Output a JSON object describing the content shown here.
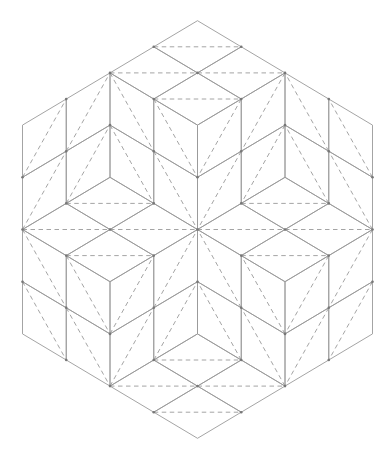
{
  "diagram": {
    "colors": {
      "background": "#ffffff",
      "line": "#9a9a9a",
      "vertex": "#777777"
    },
    "grid": {
      "origin_x": 197.5,
      "origin_y": 229.5,
      "step_x": 43.75,
      "step_y": 26.1
    },
    "hexagon": [
      [
        0,
        -8
      ],
      [
        4,
        -4
      ],
      [
        4,
        4
      ],
      [
        0,
        8
      ],
      [
        -4,
        4
      ],
      [
        -4,
        -4
      ]
    ],
    "lozenges": [
      {
        "v": [
          [
            0,
            -8
          ],
          [
            1,
            -7
          ],
          [
            0,
            -6
          ],
          [
            -1,
            -7
          ]
        ],
        "d": [
          [
            -1,
            -7
          ],
          [
            1,
            -7
          ]
        ]
      },
      {
        "v": [
          [
            -2,
            -6
          ],
          [
            -1,
            -7
          ],
          [
            0,
            -6
          ],
          [
            -1,
            -5
          ]
        ],
        "d": [
          [
            -2,
            -6
          ],
          [
            0,
            -6
          ]
        ]
      },
      {
        "v": [
          [
            0,
            -6
          ],
          [
            1,
            -7
          ],
          [
            2,
            -6
          ],
          [
            1,
            -5
          ]
        ],
        "d": [
          [
            0,
            -6
          ],
          [
            2,
            -6
          ]
        ]
      },
      {
        "v": [
          [
            -1,
            -5
          ],
          [
            0,
            -6
          ],
          [
            1,
            -5
          ],
          [
            0,
            -4
          ]
        ],
        "d": [
          [
            -1,
            -5
          ],
          [
            1,
            -5
          ]
        ]
      },
      {
        "v": [
          [
            -4,
            -4
          ],
          [
            -3,
            -5
          ],
          [
            -3,
            -3
          ],
          [
            -4,
            -2
          ]
        ],
        "d": [
          [
            -4,
            -2
          ],
          [
            -3,
            -5
          ]
        ]
      },
      {
        "v": [
          [
            -4,
            -2
          ],
          [
            -3,
            -3
          ],
          [
            -3,
            -1
          ],
          [
            -4,
            0
          ]
        ],
        "d": [
          [
            -4,
            0
          ],
          [
            -3,
            -3
          ]
        ]
      },
      {
        "v": [
          [
            -3,
            -5
          ],
          [
            -2,
            -6
          ],
          [
            -2,
            -4
          ],
          [
            -3,
            -3
          ]
        ],
        "d": [
          [
            -3,
            -3
          ],
          [
            -2,
            -6
          ]
        ]
      },
      {
        "v": [
          [
            -3,
            -3
          ],
          [
            -2,
            -4
          ],
          [
            -2,
            -2
          ],
          [
            -3,
            -1
          ]
        ],
        "d": [
          [
            -3,
            -1
          ],
          [
            -2,
            -4
          ]
        ]
      },
      {
        "v": [
          [
            -2,
            -6
          ],
          [
            -1,
            -5
          ],
          [
            -1,
            -3
          ],
          [
            -2,
            -4
          ]
        ],
        "d": [
          [
            -2,
            -6
          ],
          [
            -1,
            -3
          ]
        ]
      },
      {
        "v": [
          [
            -2,
            -4
          ],
          [
            -1,
            -3
          ],
          [
            -1,
            -1
          ],
          [
            -2,
            -2
          ]
        ],
        "d": [
          [
            -2,
            -4
          ],
          [
            -1,
            -1
          ]
        ]
      },
      {
        "v": [
          [
            -1,
            -5
          ],
          [
            0,
            -4
          ],
          [
            0,
            -2
          ],
          [
            -1,
            -3
          ]
        ],
        "d": [
          [
            -1,
            -5
          ],
          [
            0,
            -2
          ]
        ]
      },
      {
        "v": [
          [
            -1,
            -3
          ],
          [
            0,
            -2
          ],
          [
            0,
            0
          ],
          [
            -1,
            -1
          ]
        ],
        "d": [
          [
            -1,
            -3
          ],
          [
            0,
            0
          ]
        ]
      },
      {
        "v": [
          [
            4,
            -4
          ],
          [
            3,
            -5
          ],
          [
            3,
            -3
          ],
          [
            4,
            -2
          ]
        ],
        "d": [
          [
            4,
            -2
          ],
          [
            3,
            -5
          ]
        ]
      },
      {
        "v": [
          [
            4,
            -2
          ],
          [
            3,
            -3
          ],
          [
            3,
            -1
          ],
          [
            4,
            0
          ]
        ],
        "d": [
          [
            4,
            0
          ],
          [
            3,
            -3
          ]
        ]
      },
      {
        "v": [
          [
            3,
            -5
          ],
          [
            2,
            -6
          ],
          [
            2,
            -4
          ],
          [
            3,
            -3
          ]
        ],
        "d": [
          [
            3,
            -3
          ],
          [
            2,
            -6
          ]
        ]
      },
      {
        "v": [
          [
            3,
            -3
          ],
          [
            2,
            -4
          ],
          [
            2,
            -2
          ],
          [
            3,
            -1
          ]
        ],
        "d": [
          [
            3,
            -1
          ],
          [
            2,
            -4
          ]
        ]
      },
      {
        "v": [
          [
            2,
            -6
          ],
          [
            1,
            -5
          ],
          [
            1,
            -3
          ],
          [
            2,
            -4
          ]
        ],
        "d": [
          [
            2,
            -6
          ],
          [
            1,
            -3
          ]
        ]
      },
      {
        "v": [
          [
            2,
            -4
          ],
          [
            1,
            -3
          ],
          [
            1,
            -1
          ],
          [
            2,
            -2
          ]
        ],
        "d": [
          [
            2,
            -4
          ],
          [
            1,
            -1
          ]
        ]
      },
      {
        "v": [
          [
            1,
            -5
          ],
          [
            0,
            -4
          ],
          [
            0,
            -2
          ],
          [
            1,
            -3
          ]
        ],
        "d": [
          [
            1,
            -5
          ],
          [
            0,
            -2
          ]
        ]
      },
      {
        "v": [
          [
            1,
            -3
          ],
          [
            0,
            -2
          ],
          [
            0,
            0
          ],
          [
            1,
            -1
          ]
        ],
        "d": [
          [
            1,
            -3
          ],
          [
            0,
            0
          ]
        ]
      },
      {
        "v": [
          [
            -3,
            -1
          ],
          [
            -2,
            -2
          ],
          [
            -1,
            -1
          ],
          [
            -2,
            0
          ]
        ],
        "d": [
          [
            -3,
            -1
          ],
          [
            -1,
            -1
          ]
        ]
      },
      {
        "v": [
          [
            -4,
            0
          ],
          [
            -3,
            -1
          ],
          [
            -2,
            0
          ],
          [
            -3,
            1
          ]
        ],
        "d": [
          [
            -4,
            0
          ],
          [
            -2,
            0
          ]
        ]
      },
      {
        "v": [
          [
            -2,
            0
          ],
          [
            -1,
            -1
          ],
          [
            0,
            0
          ],
          [
            -1,
            1
          ]
        ],
        "d": [
          [
            -2,
            0
          ],
          [
            0,
            0
          ]
        ]
      },
      {
        "v": [
          [
            1,
            -1
          ],
          [
            2,
            -2
          ],
          [
            3,
            -1
          ],
          [
            2,
            0
          ]
        ],
        "d": [
          [
            1,
            -1
          ],
          [
            3,
            -1
          ]
        ]
      },
      {
        "v": [
          [
            0,
            0
          ],
          [
            1,
            -1
          ],
          [
            2,
            0
          ],
          [
            1,
            1
          ]
        ],
        "d": [
          [
            0,
            0
          ],
          [
            2,
            0
          ]
        ]
      },
      {
        "v": [
          [
            2,
            0
          ],
          [
            3,
            -1
          ],
          [
            4,
            0
          ],
          [
            3,
            1
          ]
        ],
        "d": [
          [
            2,
            0
          ],
          [
            4,
            0
          ]
        ]
      },
      {
        "v": [
          [
            -4,
            0
          ],
          [
            -3,
            1
          ],
          [
            -3,
            3
          ],
          [
            -4,
            2
          ]
        ],
        "d": [
          [
            -4,
            0
          ],
          [
            -3,
            3
          ]
        ]
      },
      {
        "v": [
          [
            -4,
            2
          ],
          [
            -3,
            3
          ],
          [
            -3,
            5
          ],
          [
            -4,
            4
          ]
        ],
        "d": [
          [
            -4,
            2
          ],
          [
            -3,
            5
          ]
        ]
      },
      {
        "v": [
          [
            -3,
            1
          ],
          [
            -2,
            2
          ],
          [
            -2,
            4
          ],
          [
            -3,
            3
          ]
        ],
        "d": [
          [
            -3,
            1
          ],
          [
            -2,
            4
          ]
        ]
      },
      {
        "v": [
          [
            -2,
            2
          ],
          [
            -1,
            1
          ],
          [
            -1,
            3
          ],
          [
            -2,
            4
          ]
        ],
        "d": [
          [
            -2,
            4
          ],
          [
            -1,
            1
          ]
        ]
      },
      {
        "v": [
          [
            -3,
            3
          ],
          [
            -2,
            4
          ],
          [
            -2,
            6
          ],
          [
            -3,
            5
          ]
        ],
        "d": [
          [
            -3,
            3
          ],
          [
            -2,
            6
          ]
        ]
      },
      {
        "v": [
          [
            -2,
            4
          ],
          [
            -1,
            3
          ],
          [
            -1,
            5
          ],
          [
            -2,
            6
          ]
        ],
        "d": [
          [
            -2,
            6
          ],
          [
            -1,
            3
          ]
        ]
      },
      {
        "v": [
          [
            -1,
            1
          ],
          [
            0,
            0
          ],
          [
            0,
            2
          ],
          [
            -1,
            3
          ]
        ],
        "d": [
          [
            -1,
            3
          ],
          [
            0,
            0
          ]
        ]
      },
      {
        "v": [
          [
            -1,
            3
          ],
          [
            0,
            2
          ],
          [
            0,
            4
          ],
          [
            -1,
            5
          ]
        ],
        "d": [
          [
            -1,
            5
          ],
          [
            0,
            2
          ]
        ]
      },
      {
        "v": [
          [
            4,
            0
          ],
          [
            3,
            1
          ],
          [
            3,
            3
          ],
          [
            4,
            2
          ]
        ],
        "d": [
          [
            4,
            0
          ],
          [
            3,
            3
          ]
        ]
      },
      {
        "v": [
          [
            4,
            2
          ],
          [
            3,
            3
          ],
          [
            3,
            5
          ],
          [
            4,
            4
          ]
        ],
        "d": [
          [
            4,
            2
          ],
          [
            3,
            5
          ]
        ]
      },
      {
        "v": [
          [
            3,
            1
          ],
          [
            2,
            2
          ],
          [
            2,
            4
          ],
          [
            3,
            3
          ]
        ],
        "d": [
          [
            3,
            1
          ],
          [
            2,
            4
          ]
        ]
      },
      {
        "v": [
          [
            2,
            2
          ],
          [
            1,
            1
          ],
          [
            1,
            3
          ],
          [
            2,
            4
          ]
        ],
        "d": [
          [
            2,
            4
          ],
          [
            1,
            1
          ]
        ]
      },
      {
        "v": [
          [
            3,
            3
          ],
          [
            2,
            4
          ],
          [
            2,
            6
          ],
          [
            3,
            5
          ]
        ],
        "d": [
          [
            3,
            3
          ],
          [
            2,
            6
          ]
        ]
      },
      {
        "v": [
          [
            2,
            4
          ],
          [
            1,
            3
          ],
          [
            1,
            5
          ],
          [
            2,
            6
          ]
        ],
        "d": [
          [
            2,
            6
          ],
          [
            1,
            3
          ]
        ]
      },
      {
        "v": [
          [
            1,
            1
          ],
          [
            0,
            0
          ],
          [
            0,
            2
          ],
          [
            1,
            3
          ]
        ],
        "d": [
          [
            1,
            3
          ],
          [
            0,
            0
          ]
        ]
      },
      {
        "v": [
          [
            1,
            3
          ],
          [
            0,
            2
          ],
          [
            0,
            4
          ],
          [
            1,
            5
          ]
        ],
        "d": [
          [
            1,
            5
          ],
          [
            0,
            2
          ]
        ]
      },
      {
        "v": [
          [
            -3,
            1
          ],
          [
            -2,
            0
          ],
          [
            -1,
            1
          ],
          [
            -2,
            2
          ]
        ],
        "d": [
          [
            -3,
            1
          ],
          [
            -1,
            1
          ]
        ]
      },
      {
        "v": [
          [
            1,
            1
          ],
          [
            2,
            0
          ],
          [
            3,
            1
          ],
          [
            2,
            2
          ]
        ],
        "d": [
          [
            1,
            1
          ],
          [
            3,
            1
          ]
        ]
      },
      {
        "v": [
          [
            -1,
            5
          ],
          [
            0,
            4
          ],
          [
            1,
            5
          ],
          [
            0,
            6
          ]
        ],
        "d": [
          [
            -1,
            5
          ],
          [
            1,
            5
          ]
        ]
      },
      {
        "v": [
          [
            -2,
            6
          ],
          [
            -1,
            5
          ],
          [
            0,
            6
          ],
          [
            -1,
            7
          ]
        ],
        "d": [
          [
            -2,
            6
          ],
          [
            0,
            6
          ]
        ]
      },
      {
        "v": [
          [
            0,
            6
          ],
          [
            1,
            5
          ],
          [
            2,
            6
          ],
          [
            1,
            7
          ]
        ],
        "d": [
          [
            0,
            6
          ],
          [
            2,
            6
          ]
        ]
      },
      {
        "v": [
          [
            -1,
            7
          ],
          [
            0,
            6
          ],
          [
            1,
            7
          ],
          [
            0,
            8
          ]
        ],
        "d": [
          [
            -1,
            7
          ],
          [
            1,
            7
          ]
        ]
      }
    ]
  }
}
